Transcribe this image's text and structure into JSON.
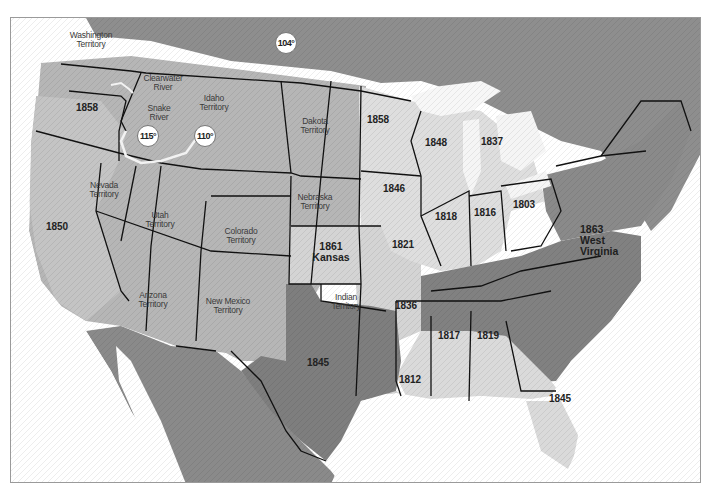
{
  "map": {
    "type": "historical statehood map of the United States",
    "colors": {
      "ocean": "#ffffff",
      "foreign_land": "#8a8a8a",
      "territory_land": "#b9b9b9",
      "admitted_light": "#dcdcdc",
      "southeast_dark": "#7f7f7f",
      "border": "#111111",
      "river": "#f4f4f4"
    },
    "territories": [
      {
        "name": "Washington Territory",
        "line1": "Washington",
        "line2": "Territory"
      },
      {
        "name": "Idaho Territory",
        "line1": "Idaho",
        "line2": "Territory"
      },
      {
        "name": "Dakota Territory",
        "line1": "Dakota",
        "line2": "Territory"
      },
      {
        "name": "Nebraska Territory",
        "line1": "Nebraska",
        "line2": "Territory"
      },
      {
        "name": "Nevada Territory",
        "line1": "Nevada",
        "line2": "Territory"
      },
      {
        "name": "Utah Territory",
        "line1": "Utah",
        "line2": "Territory"
      },
      {
        "name": "Colorado Territory",
        "line1": "Colorado",
        "line2": "Territory"
      },
      {
        "name": "Arizona Territory",
        "line1": "Arizona",
        "line2": "Territory"
      },
      {
        "name": "New Mexico Territory",
        "line1": "New Mexico",
        "line2": "Territory"
      },
      {
        "name": "Indian Territory",
        "line1": "Indian",
        "line2": "Territory"
      }
    ],
    "rivers": [
      {
        "line1": "Clearwater",
        "line2": "River"
      },
      {
        "line1": "Snake",
        "line2": "River"
      }
    ],
    "years": {
      "oregon": "1858",
      "california": "1850",
      "minnesota": "1858",
      "wisconsin": "1848",
      "michigan": "1837",
      "iowa": "1846",
      "illinois": "1818",
      "indiana": "1816",
      "ohio": "1803",
      "missouri": "1821",
      "arkansas": "1836",
      "mississippi": "1817",
      "alabama": "1819",
      "louisiana": "1812",
      "texas": "1845",
      "florida": "1845"
    },
    "kansas": {
      "year": "1861",
      "name": "Kansas"
    },
    "west_virginia": {
      "year": "1863",
      "line1": "West",
      "line2": "Virginia"
    },
    "meridians": [
      "115°",
      "110°",
      "104°"
    ]
  }
}
